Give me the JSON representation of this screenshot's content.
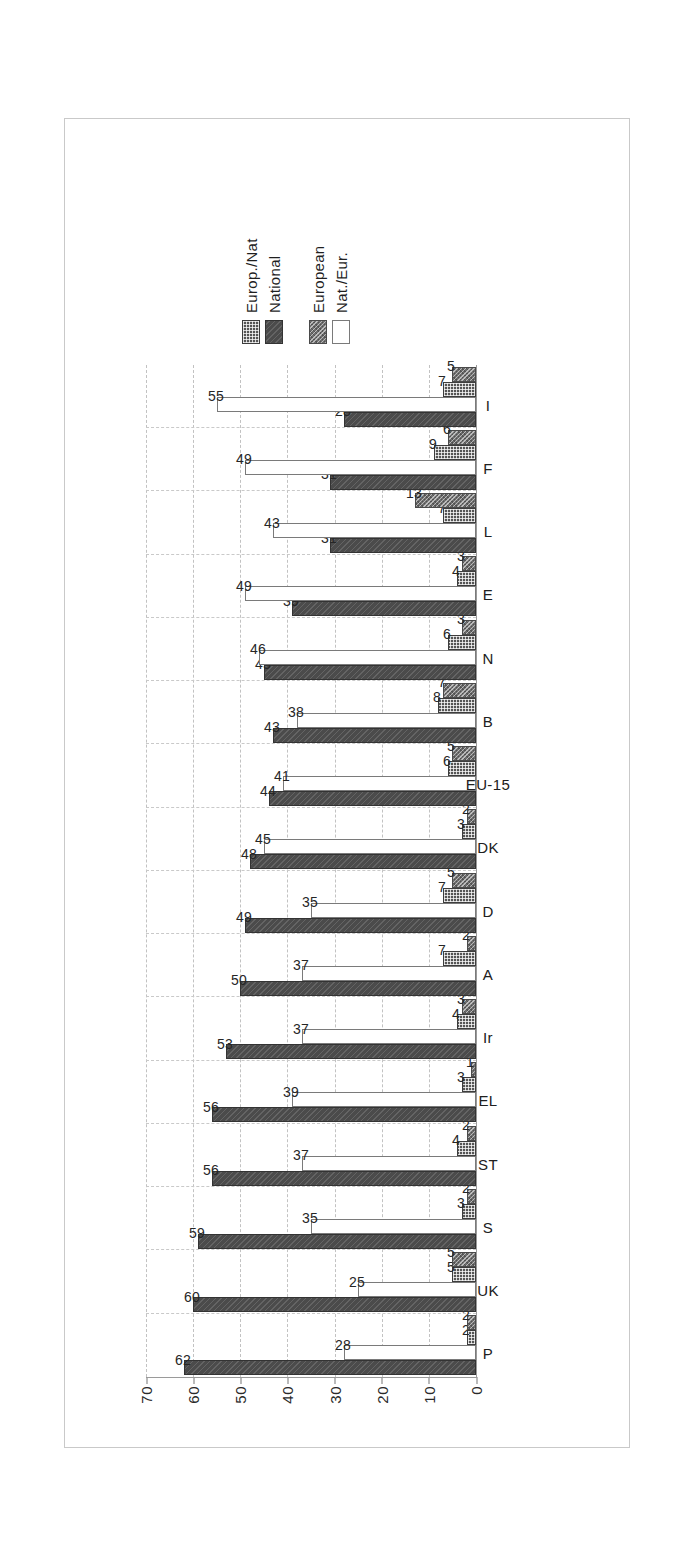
{
  "chart_data": {
    "type": "bar",
    "orientation": "horizontal-rotated",
    "title": "",
    "xlabel": "",
    "ylabel": "",
    "ylim": [
      0,
      70
    ],
    "yticks": [
      "0",
      "10",
      "20",
      "30",
      "40",
      "50",
      "60",
      "70"
    ],
    "grid": true,
    "legend_position": "right",
    "categories": [
      "P",
      "UK",
      "S",
      "ST",
      "EL",
      "Ir",
      "A",
      "D",
      "DK",
      "EU-15",
      "B",
      "N",
      "E",
      "L",
      "F",
      "I"
    ],
    "series": [
      {
        "name": "National",
        "key": "national",
        "values": [
          62,
          60,
          59,
          56,
          56,
          53,
          50,
          49,
          48,
          44,
          43,
          45,
          39,
          31,
          31,
          28
        ]
      },
      {
        "name": "Nat./Eur.",
        "key": "nateur",
        "values": [
          28,
          25,
          35,
          37,
          39,
          37,
          37,
          35,
          45,
          41,
          38,
          46,
          49,
          43,
          49,
          55
        ]
      },
      {
        "name": "Europ./Nat",
        "key": "europnat",
        "values": [
          2,
          5,
          3,
          4,
          3,
          4,
          7,
          7,
          3,
          6,
          8,
          6,
          4,
          7,
          9,
          7
        ]
      },
      {
        "name": "European",
        "key": "european",
        "values": [
          2,
          5,
          2,
          2,
          1,
          3,
          2,
          5,
          2,
          5,
          7,
          3,
          3,
          13,
          6,
          5
        ]
      }
    ]
  },
  "legend": {
    "group_left": [
      {
        "label": "European",
        "swatch": "european-swatch"
      },
      {
        "label": "Nat./Eur.",
        "swatch": "nateur-swatch"
      }
    ],
    "group_right": [
      {
        "label": "Europ./Nat",
        "swatch": "europnat-swatch"
      },
      {
        "label": "National",
        "swatch": "national-swatch"
      }
    ]
  },
  "colors": {
    "national": "#4b4b4b",
    "europnat": "#555555",
    "nateur": "#ffffff",
    "european": "#6e6e6e",
    "grid": "#c2c2c2",
    "axis": "#9a9a9a",
    "text": "#202020"
  }
}
